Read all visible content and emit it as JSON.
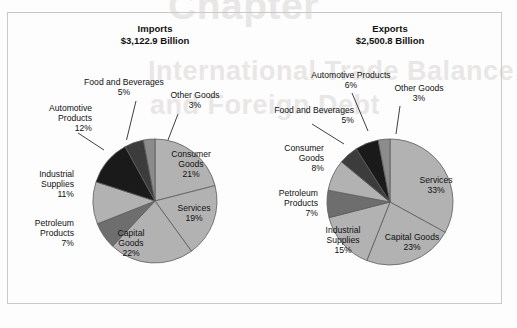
{
  "chart_data": [
    {
      "type": "pie",
      "title": "Imports",
      "subtitle": "$3,122.9 Billion",
      "total_label": "$3,122.9 Billion",
      "units": "percent of total",
      "categories": [
        "Consumer Goods",
        "Services",
        "Capital Goods",
        "Petroleum Products",
        "Industrial Supplies",
        "Automotive Products",
        "Food and Beverages",
        "Other Goods"
      ],
      "values": [
        21,
        19,
        22,
        7,
        11,
        12,
        5,
        3
      ],
      "labels": [
        "21%",
        "19%",
        "22%",
        "7%",
        "11%",
        "12%",
        "5%",
        "3%"
      ],
      "colors": [
        "#b2b2b2",
        "#b2b2b2",
        "#b2b2b2",
        "#6e6e6e",
        "#b2b2b2",
        "#1a1a1a",
        "#3c3c3c",
        "#8c8c8c"
      ],
      "start_angle": 0,
      "direction": "clockwise",
      "legend": "none",
      "grid": false
    },
    {
      "type": "pie",
      "title": "Exports",
      "subtitle": "$2,500.8 Billion",
      "total_label": "$2,500.8 Billion",
      "units": "percent of total",
      "categories": [
        "Services",
        "Capital Goods",
        "Industrial Supplies",
        "Petroleum Products",
        "Consumer Goods",
        "Food and Beverages",
        "Automotive Products",
        "Other Goods"
      ],
      "values": [
        33,
        23,
        15,
        7,
        8,
        5,
        6,
        3
      ],
      "labels": [
        "33%",
        "23%",
        "15%",
        "7%",
        "8%",
        "5%",
        "6%",
        "3%"
      ],
      "colors": [
        "#b2b2b2",
        "#b2b2b2",
        "#b2b2b2",
        "#6e6e6e",
        "#b2b2b2",
        "#3c3c3c",
        "#1a1a1a",
        "#8c8c8c"
      ],
      "start_angle": 0,
      "direction": "clockwise",
      "legend": "none",
      "grid": false
    }
  ],
  "imports": {
    "title": "Imports",
    "amount": "$3,122.9 Billion",
    "slices": {
      "consumer_goods": {
        "name": "Consumer",
        "name2": "Goods",
        "pct": "21%"
      },
      "services": {
        "name": "Services",
        "pct": "19%"
      },
      "capital_goods": {
        "name": "Capital",
        "name2": "Goods",
        "pct": "22%"
      },
      "petroleum": {
        "name": "Petroleum",
        "name2": "Products",
        "pct": "7%"
      },
      "industrial": {
        "name": "Industrial",
        "name2": "Supplies",
        "pct": "11%"
      },
      "automotive": {
        "name": "Automotive",
        "name2": "Products",
        "pct": "12%"
      },
      "food": {
        "name": "Food and Beverages",
        "pct": "5%"
      },
      "other": {
        "name": "Other Goods",
        "pct": "3%"
      }
    }
  },
  "exports": {
    "title": "Exports",
    "amount": "$2,500.8 Billion",
    "slices": {
      "services": {
        "name": "Services",
        "pct": "33%"
      },
      "capital_goods": {
        "name": "Capital Goods",
        "pct": "23%"
      },
      "industrial": {
        "name": "Industrial",
        "name2": "Supplies",
        "pct": "15%"
      },
      "petroleum": {
        "name": "Petroleum",
        "name2": "Products",
        "pct": "7%"
      },
      "consumer_goods": {
        "name": "Consumer",
        "name2": "Goods",
        "pct": "8%"
      },
      "food": {
        "name": "Food and Beverages",
        "pct": "5%"
      },
      "automotive": {
        "name": "Automotive Products",
        "pct": "6%"
      },
      "other": {
        "name": "Other Goods",
        "pct": "3%"
      }
    }
  },
  "background_text": {
    "line1": "International Trade Balance",
    "line2": "and Foreign Debt",
    "line3": "Chapter"
  },
  "colors": {
    "slice_light": "#b2b2b2",
    "slice_medium": "#8c8c8c",
    "slice_dark_gray": "#6e6e6e",
    "slice_darker": "#3c3c3c",
    "slice_black": "#1a1a1a",
    "outline": "#5c5c5c",
    "frame": "#c9c9c9",
    "text": "#111111"
  }
}
